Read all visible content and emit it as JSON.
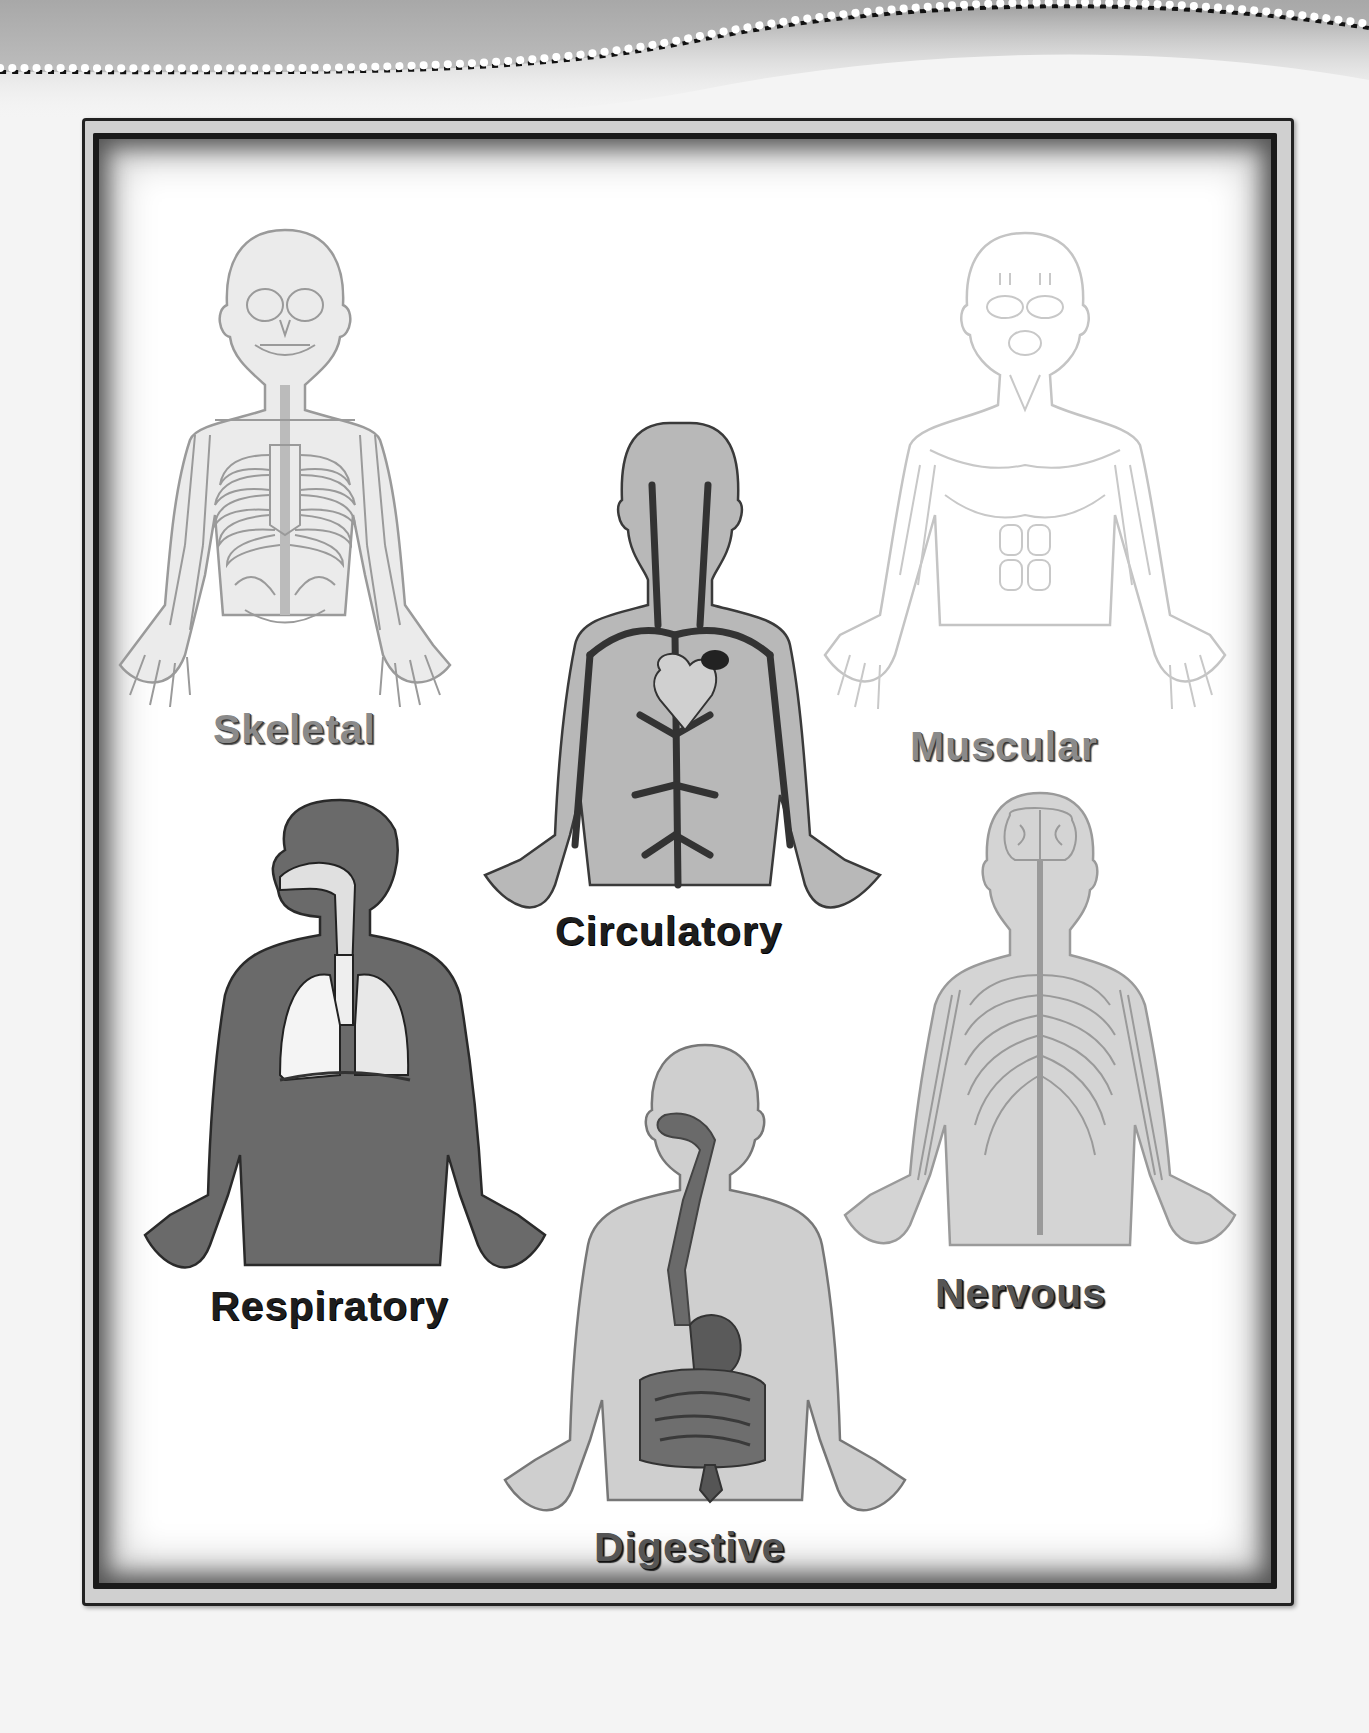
{
  "page": {
    "background_color": "#f4f4f4",
    "frame_color": "#1a1a1a"
  },
  "systems": [
    {
      "id": "skeletal",
      "label": "Skeletal",
      "fill": "#ebebeb",
      "stroke": "#9a9a9a"
    },
    {
      "id": "circulatory",
      "label": "Circulatory",
      "fill": "#b8b8b8",
      "stroke": "#3a3a3a"
    },
    {
      "id": "muscular",
      "label": "Muscular",
      "fill": "#ffffff",
      "stroke": "#c4c4c4"
    },
    {
      "id": "respiratory",
      "label": "Respiratory",
      "fill": "#6a6a6a",
      "stroke": "#2a2a2a"
    },
    {
      "id": "nervous",
      "label": "Nervous",
      "fill": "#d4d4d4",
      "stroke": "#9a9a9a"
    },
    {
      "id": "digestive",
      "label": "Digestive",
      "fill": "#cfcfcf",
      "stroke": "#777777"
    }
  ]
}
